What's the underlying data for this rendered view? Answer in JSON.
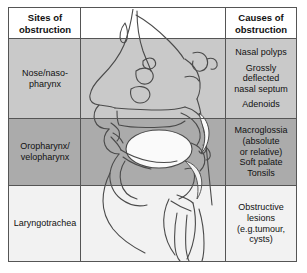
{
  "figure": {
    "columns": {
      "sites_header_line1": "Sites of",
      "sites_header_line2": "obstruction",
      "illustration_header": "",
      "causes_header_line1": "Causes of",
      "causes_header_line2": "obstruction"
    },
    "rows": [
      {
        "id": "nose-nasopharynx",
        "site_line1": "Nose/naso-",
        "site_line2": "pharynx",
        "causes": [
          "Nasal polyps",
          "Grossly",
          "deflected",
          "nasal septum",
          "Adenoids"
        ],
        "band_color": "#c9c9c9"
      },
      {
        "id": "oropharynx-velopharynx",
        "site_line1": "Oropharynx/",
        "site_line2": "velopharynx",
        "causes": [
          "Macroglossia",
          "(absolute",
          "or relative)",
          "Soft palate",
          "Tonsils"
        ],
        "band_color": "#ababab"
      },
      {
        "id": "laryngotrachea",
        "site_line1": "Laryngotrachea",
        "site_line2": "",
        "causes": [
          "Obstructive",
          "lesions",
          "(e.g.tumour,",
          "cysts)"
        ],
        "band_color": "#f2f2f2"
      }
    ],
    "illustration": {
      "name": "sagittal-head-airway-diagram",
      "description": "Mid-sagittal line drawing of the head showing nasal cavity, nasopharynx, oral cavity, tongue, soft palate, epiglottis, larynx and trachea",
      "line_color": "#4a4a4a",
      "tongue_fill": "#f7f7f7",
      "palate_fill": "#fafafa"
    },
    "colors": {
      "frame_border": "#555555",
      "text": "#111111",
      "background": "#ffffff"
    }
  }
}
